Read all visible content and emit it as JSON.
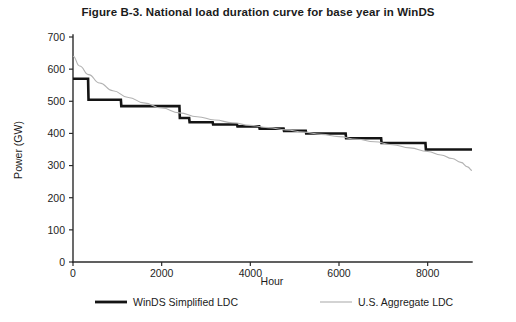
{
  "figure": {
    "title": "Figure B-3. National load duration curve for base year in WinDS"
  },
  "chart_data": {
    "type": "line",
    "title": "Figure B-3. National load duration curve for base year in WinDS",
    "xlabel": "Hour",
    "ylabel": "Power (GW)",
    "xlim": [
      0,
      9000
    ],
    "ylim": [
      0,
      700
    ],
    "xticks": [
      0,
      2000,
      4000,
      6000,
      8000
    ],
    "yticks": [
      0,
      100,
      200,
      300,
      400,
      500,
      600,
      700
    ],
    "grid": false,
    "legend_position": "below-plot",
    "series": [
      {
        "name": "WinDS Simplified LDC",
        "style": "step",
        "color": "#141414",
        "width": 2.6,
        "points": [
          {
            "x": 0,
            "y": 570
          },
          {
            "x": 340,
            "y": 570
          },
          {
            "x": 350,
            "y": 505
          },
          {
            "x": 1080,
            "y": 505
          },
          {
            "x": 1090,
            "y": 485
          },
          {
            "x": 2400,
            "y": 485
          },
          {
            "x": 2410,
            "y": 448
          },
          {
            "x": 2620,
            "y": 448
          },
          {
            "x": 2630,
            "y": 435
          },
          {
            "x": 3150,
            "y": 435
          },
          {
            "x": 3160,
            "y": 428
          },
          {
            "x": 3700,
            "y": 428
          },
          {
            "x": 3710,
            "y": 422
          },
          {
            "x": 4200,
            "y": 422
          },
          {
            "x": 4210,
            "y": 415
          },
          {
            "x": 4750,
            "y": 415
          },
          {
            "x": 4760,
            "y": 408
          },
          {
            "x": 5250,
            "y": 408
          },
          {
            "x": 5260,
            "y": 400
          },
          {
            "x": 6150,
            "y": 400
          },
          {
            "x": 6160,
            "y": 385
          },
          {
            "x": 6950,
            "y": 385
          },
          {
            "x": 6960,
            "y": 370
          },
          {
            "x": 7950,
            "y": 370
          },
          {
            "x": 7960,
            "y": 350
          },
          {
            "x": 9000,
            "y": 350
          }
        ]
      },
      {
        "name": "U.S. Aggregate LDC",
        "style": "smooth",
        "color": "#b2b2b2",
        "width": 1.1,
        "points": [
          {
            "x": 0,
            "y": 640
          },
          {
            "x": 150,
            "y": 610
          },
          {
            "x": 350,
            "y": 583
          },
          {
            "x": 600,
            "y": 557
          },
          {
            "x": 900,
            "y": 533
          },
          {
            "x": 1250,
            "y": 512
          },
          {
            "x": 1600,
            "y": 495
          },
          {
            "x": 2000,
            "y": 479
          },
          {
            "x": 2400,
            "y": 464
          },
          {
            "x": 2800,
            "y": 452
          },
          {
            "x": 3200,
            "y": 442
          },
          {
            "x": 3600,
            "y": 433
          },
          {
            "x": 4000,
            "y": 425
          },
          {
            "x": 4400,
            "y": 418
          },
          {
            "x": 4800,
            "y": 411
          },
          {
            "x": 5200,
            "y": 404
          },
          {
            "x": 5600,
            "y": 397
          },
          {
            "x": 6000,
            "y": 390
          },
          {
            "x": 6400,
            "y": 382
          },
          {
            "x": 6800,
            "y": 374
          },
          {
            "x": 7200,
            "y": 365
          },
          {
            "x": 7600,
            "y": 355
          },
          {
            "x": 8000,
            "y": 344
          },
          {
            "x": 8300,
            "y": 333
          },
          {
            "x": 8550,
            "y": 322
          },
          {
            "x": 8750,
            "y": 310
          },
          {
            "x": 8900,
            "y": 296
          },
          {
            "x": 9000,
            "y": 285
          }
        ]
      }
    ]
  },
  "legend": {
    "entries": [
      {
        "label": "WinDS Simplified LDC",
        "color": "#141414",
        "width": 2.8
      },
      {
        "label": "U.S. Aggregate LDC",
        "color": "#b0b0b0",
        "width": 1.1
      }
    ]
  }
}
